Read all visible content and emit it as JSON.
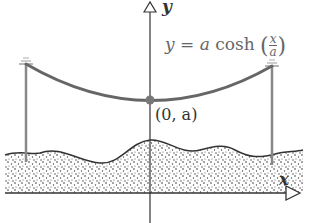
{
  "figure": {
    "type": "catenary diagram",
    "equation": {
      "lhs": "y = a",
      "func": "cosh",
      "arg_num": "x",
      "arg_den": "a",
      "full": "y = a cosh(x/a)"
    },
    "axes": {
      "x_label": "x",
      "y_label": "y"
    },
    "vertex_label": "(0, a)",
    "elements": [
      "left utility pole",
      "right utility pole",
      "hanging cable (catenary)",
      "stippled ground terrain",
      "vertex point"
    ],
    "colors": {
      "cable": "#666666",
      "pole": "#888888",
      "axis": "#333333",
      "ground_outline": "#333333",
      "vertex": "#777777"
    }
  }
}
